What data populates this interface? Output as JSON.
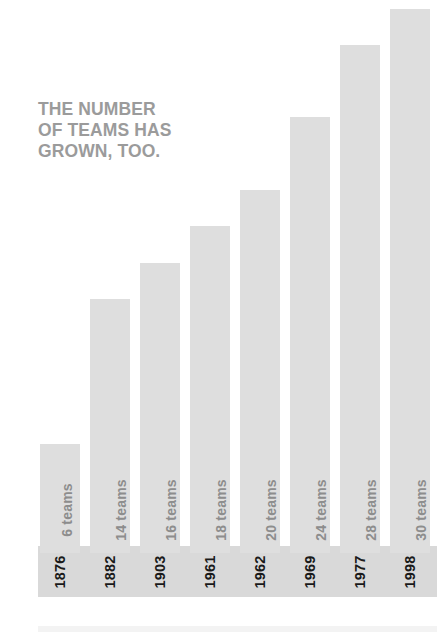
{
  "headline": "THE NUMBER\nOF TEAMS HAS\nGROWN, TOO.",
  "colors": {
    "bar": "#dedede",
    "band": "#d9d9d9",
    "headline_text": "#9b9b9b",
    "teams_label_text": "#8d8d8d",
    "year_label_text": "#1a1a1a",
    "background": "#ffffff"
  },
  "chart_data": {
    "type": "bar",
    "title": "THE NUMBER OF TEAMS HAS GROWN, TOO.",
    "xlabel": "",
    "ylabel": "",
    "ylim": [
      0,
      32
    ],
    "grid": false,
    "legend": null,
    "orientation": "vertical",
    "categories": [
      "1876",
      "1882",
      "1903",
      "1961",
      "1962",
      "1969",
      "1977",
      "1998"
    ],
    "values": [
      6,
      14,
      16,
      18,
      20,
      24,
      28,
      30
    ],
    "value_labels": [
      "6 teams",
      "14 teams",
      "16 teams",
      "18 teams",
      "20 teams",
      "24 teams",
      "28 teams",
      "30 teams"
    ],
    "bars": [
      {
        "year": "1876",
        "teams": 6,
        "value_label": "6 teams"
      },
      {
        "year": "1882",
        "teams": 14,
        "value_label": "14 teams"
      },
      {
        "year": "1903",
        "teams": 16,
        "value_label": "16 teams"
      },
      {
        "year": "1961",
        "teams": 18,
        "value_label": "18 teams"
      },
      {
        "year": "1962",
        "teams": 20,
        "value_label": "20 teams"
      },
      {
        "year": "1969",
        "teams": 24,
        "value_label": "24 teams"
      },
      {
        "year": "1977",
        "teams": 28,
        "value_label": "28 teams"
      },
      {
        "year": "1998",
        "teams": 30,
        "value_label": "30 teams"
      }
    ]
  }
}
